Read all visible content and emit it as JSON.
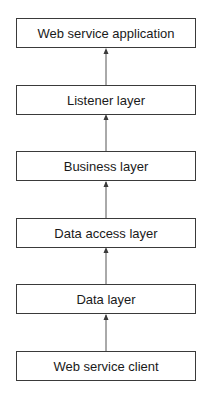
{
  "diagram": {
    "type": "layered-stack",
    "nodes": [
      {
        "id": "app",
        "label": "Web service application"
      },
      {
        "id": "listener",
        "label": "Listener layer"
      },
      {
        "id": "business",
        "label": "Business layer"
      },
      {
        "id": "dataaccess",
        "label": "Data access layer"
      },
      {
        "id": "data",
        "label": "Data layer"
      },
      {
        "id": "client",
        "label": "Web service client"
      }
    ],
    "edges": [
      {
        "from": "client",
        "to": "data"
      },
      {
        "from": "data",
        "to": "dataaccess"
      },
      {
        "from": "dataaccess",
        "to": "business"
      },
      {
        "from": "business",
        "to": "listener"
      },
      {
        "from": "listener",
        "to": "app"
      }
    ],
    "colors": {
      "stroke": "#3a3a3a",
      "text": "#1a1a1a",
      "background": "#ffffff"
    }
  }
}
